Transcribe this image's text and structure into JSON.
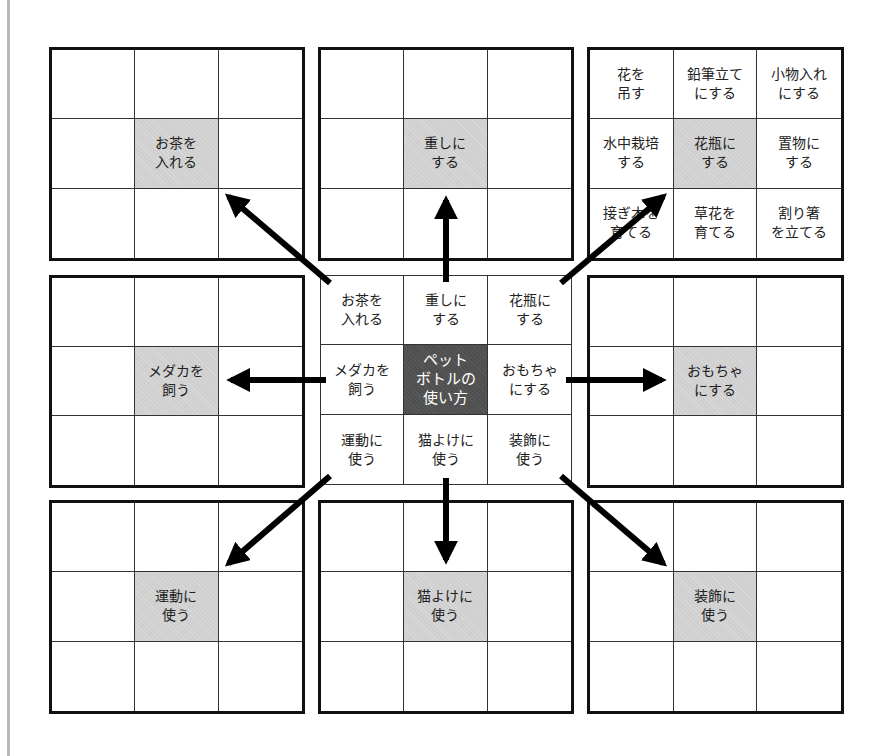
{
  "diagram": {
    "colors": {
      "theme_cell": "#cfcfcf",
      "core_cell": "#4f4f4f",
      "border": "#111111",
      "arrow": "#000000"
    },
    "center": {
      "core": "ペット\nボトルの\n使い方",
      "cells": [
        "お茶を\n入れる",
        "重しに\nする",
        "花瓶に\nする",
        "メダカを\n飼う",
        "ペット\nボトルの\n使い方",
        "おもちゃ\nにする",
        "運動に\n使う",
        "猫よけに\n使う",
        "装飾に\n使う"
      ]
    },
    "outer": {
      "top_left": {
        "theme": "お茶を\n入れる",
        "cells": [
          "",
          "",
          "",
          "",
          "お茶を\n入れる",
          "",
          "",
          "",
          ""
        ]
      },
      "top_center": {
        "theme": "重しに\nする",
        "cells": [
          "",
          "",
          "",
          "",
          "重しに\nする",
          "",
          "",
          "",
          ""
        ]
      },
      "top_right": {
        "theme": "花瓶に\nする",
        "cells": [
          "花を\n吊す",
          "鉛筆立て\nにする",
          "小物入れ\nにする",
          "水中栽培\nする",
          "花瓶に\nする",
          "置物に\nする",
          "接ぎ木を\n育てる",
          "草花を\n育てる",
          "割り箸\nを立てる"
        ]
      },
      "middle_left": {
        "theme": "メダカを\n飼う",
        "cells": [
          "",
          "",
          "",
          "",
          "メダカを\n飼う",
          "",
          "",
          "",
          ""
        ]
      },
      "middle_right": {
        "theme": "おもちゃ\nにする",
        "cells": [
          "",
          "",
          "",
          "",
          "おもちゃ\nにする",
          "",
          "",
          "",
          ""
        ]
      },
      "bottom_left": {
        "theme": "運動に\n使う",
        "cells": [
          "",
          "",
          "",
          "",
          "運動に\n使う",
          "",
          "",
          "",
          ""
        ]
      },
      "bottom_center": {
        "theme": "猫よけに\n使う",
        "cells": [
          "",
          "",
          "",
          "",
          "猫よけに\n使う",
          "",
          "",
          "",
          ""
        ]
      },
      "bottom_right": {
        "theme": "装飾に\n使う",
        "cells": [
          "",
          "",
          "",
          "",
          "装飾に\n使う",
          "",
          "",
          "",
          ""
        ]
      }
    },
    "arrows": [
      {
        "name": "arrow-to-top-left",
        "x1": 330,
        "y1": 283,
        "x2": 221,
        "y2": 190
      },
      {
        "name": "arrow-to-top-center",
        "x1": 446,
        "y1": 282,
        "x2": 446,
        "y2": 190
      },
      {
        "name": "arrow-to-top-right",
        "x1": 561,
        "y1": 283,
        "x2": 671,
        "y2": 190
      },
      {
        "name": "arrow-to-middle-left",
        "x1": 326,
        "y1": 380,
        "x2": 221,
        "y2": 380
      },
      {
        "name": "arrow-to-middle-right",
        "x1": 566,
        "y1": 380,
        "x2": 672,
        "y2": 380
      },
      {
        "name": "arrow-to-bottom-left",
        "x1": 330,
        "y1": 476,
        "x2": 221,
        "y2": 570
      },
      {
        "name": "arrow-to-bottom-center",
        "x1": 446,
        "y1": 478,
        "x2": 446,
        "y2": 570
      },
      {
        "name": "arrow-to-bottom-right",
        "x1": 561,
        "y1": 476,
        "x2": 671,
        "y2": 570
      }
    ]
  }
}
